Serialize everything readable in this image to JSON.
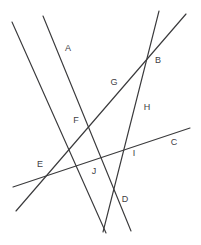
{
  "figure": {
    "kind": "line-arrangement-diagram",
    "width": 201,
    "height": 245,
    "background_color": "#ffffff",
    "line_color": "#3a3a3c",
    "label_color": "#404044"
  },
  "labels": [
    {
      "text": "A",
      "x": 68,
      "y": 48
    },
    {
      "text": "B",
      "x": 158,
      "y": 60
    },
    {
      "text": "C",
      "x": 174,
      "y": 142
    },
    {
      "text": "D",
      "x": 125,
      "y": 199
    },
    {
      "text": "E",
      "x": 40,
      "y": 164
    },
    {
      "text": "F",
      "x": 76,
      "y": 120
    },
    {
      "text": "G",
      "x": 114,
      "y": 82
    },
    {
      "text": "H",
      "x": 147,
      "y": 107
    },
    {
      "text": "I",
      "x": 134,
      "y": 153
    },
    {
      "text": "J",
      "x": 94,
      "y": 171
    }
  ],
  "lines": [
    {
      "id": "line-1",
      "x1": 12,
      "y1": 22,
      "x2": 106,
      "y2": 233
    },
    {
      "id": "line-2",
      "x1": 43,
      "y1": 16,
      "x2": 131,
      "y2": 231
    },
    {
      "id": "line-3",
      "x1": 159,
      "y1": 11,
      "x2": 103,
      "y2": 232
    },
    {
      "id": "line-4",
      "x1": 186,
      "y1": 14,
      "x2": 16,
      "y2": 211
    },
    {
      "id": "line-5",
      "x1": 13,
      "y1": 187,
      "x2": 190,
      "y2": 128
    }
  ],
  "vertices": [
    {
      "name": "A",
      "x": 62,
      "y": 56
    },
    {
      "name": "B",
      "x": 151,
      "y": 58
    },
    {
      "name": "C",
      "x": 168,
      "y": 134
    },
    {
      "name": "D",
      "x": 117,
      "y": 196
    },
    {
      "name": "E",
      "x": 48,
      "y": 172
    },
    {
      "name": "F",
      "x": 85,
      "y": 124
    },
    {
      "name": "G",
      "x": 116,
      "y": 94
    },
    {
      "name": "H",
      "x": 140,
      "y": 104
    },
    {
      "name": "I",
      "x": 129,
      "y": 148
    },
    {
      "name": "J",
      "x": 98,
      "y": 169
    }
  ]
}
